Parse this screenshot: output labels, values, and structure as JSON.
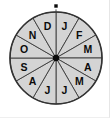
{
  "figure": {
    "name": "month-spinner",
    "background_color": "#ffffff"
  },
  "chart_data": {
    "type": "pie",
    "title": "",
    "subtitle": "",
    "xlabel": "",
    "ylabel": "",
    "legend": "none",
    "grid": false,
    "equal_sectors": true,
    "sector_count": 12,
    "sector_angle_degrees": 30,
    "start_angle_degrees": 0,
    "direction": "clockwise",
    "categories": [
      "J",
      "F",
      "M",
      "A",
      "M",
      "J",
      "J",
      "A",
      "S",
      "O",
      "N",
      "D"
    ],
    "values": [
      1,
      1,
      1,
      1,
      1,
      1,
      1,
      1,
      1,
      1,
      1,
      1
    ],
    "sectors": [
      {
        "label": "J",
        "month": "January",
        "index": 0,
        "start_deg": 0,
        "end_deg": 30,
        "mid_deg": 15
      },
      {
        "label": "F",
        "month": "February",
        "index": 1,
        "start_deg": 30,
        "end_deg": 60,
        "mid_deg": 45
      },
      {
        "label": "M",
        "month": "March",
        "index": 2,
        "start_deg": 60,
        "end_deg": 90,
        "mid_deg": 75
      },
      {
        "label": "A",
        "month": "April",
        "index": 3,
        "start_deg": 90,
        "end_deg": 120,
        "mid_deg": 105
      },
      {
        "label": "M",
        "month": "May",
        "index": 4,
        "start_deg": 120,
        "end_deg": 150,
        "mid_deg": 135
      },
      {
        "label": "J",
        "month": "June",
        "index": 5,
        "start_deg": 150,
        "end_deg": 180,
        "mid_deg": 165
      },
      {
        "label": "J",
        "month": "July",
        "index": 6,
        "start_deg": 180,
        "end_deg": 210,
        "mid_deg": 195
      },
      {
        "label": "A",
        "month": "August",
        "index": 7,
        "start_deg": 210,
        "end_deg": 240,
        "mid_deg": 225
      },
      {
        "label": "S",
        "month": "September",
        "index": 8,
        "start_deg": 240,
        "end_deg": 270,
        "mid_deg": 255
      },
      {
        "label": "O",
        "month": "October",
        "index": 9,
        "start_deg": 270,
        "end_deg": 300,
        "mid_deg": 285
      },
      {
        "label": "N",
        "month": "November",
        "index": 10,
        "start_deg": 300,
        "end_deg": 330,
        "mid_deg": 315
      },
      {
        "label": "D",
        "month": "December",
        "index": 11,
        "start_deg": 330,
        "end_deg": 360,
        "mid_deg": 345
      }
    ],
    "colors": {
      "sector_fill": "#d4d4d4",
      "sector_stroke": "#3b3b3b",
      "rim_stroke": "#333333",
      "label_text": "#0b0b0b",
      "hub": "#0a0a0a",
      "pointer": "#0a0a0a"
    },
    "geometry": {
      "center_x": 56,
      "center_y": 58,
      "radius": 46,
      "label_radius": 33,
      "hub_radius": 3.2,
      "pointer_x": 56,
      "pointer_y": 6,
      "pointer_size": 3.4
    }
  }
}
